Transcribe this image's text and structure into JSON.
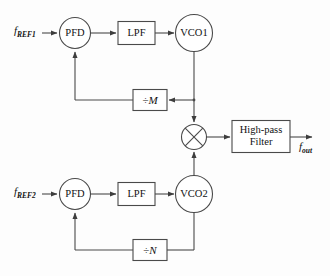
{
  "diagram": {
    "stroke_color": "#4a4a4a",
    "text_color": "#111111",
    "background": "#fdfdfd"
  },
  "signals": {
    "ref1_base": "f",
    "ref1_sub": "REF1",
    "ref2_base": "f",
    "ref2_sub": "REF2",
    "out_base": "f",
    "out_sub": "out"
  },
  "blocks": {
    "pfd1": "PFD",
    "lpf1": "LPF",
    "vco1": "VCO1",
    "div_m_symbol": "÷",
    "div_m_var": "M",
    "pfd2": "PFD",
    "lpf2": "LPF",
    "vco2": "VCO2",
    "div_n_symbol": "÷",
    "div_n_var": "N",
    "hpf_line1": "High-pass",
    "hpf_line2": "Filter",
    "mixer": "mixer"
  }
}
